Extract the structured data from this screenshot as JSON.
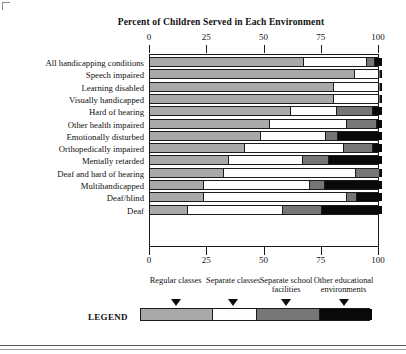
{
  "chart_data": {
    "type": "bar",
    "orientation": "horizontal",
    "stacked": true,
    "title": "Percent of Children Served in Each Environment",
    "xlabel": "",
    "ylabel": "",
    "xlim": [
      0,
      100
    ],
    "xticks": [
      0,
      25,
      50,
      75,
      100
    ],
    "xticklabels": [
      "0",
      "25",
      "50",
      "75",
      "100"
    ],
    "grid": false,
    "legend_position": "bottom",
    "categories": [
      "All handicapping conditions",
      "Speech impaired",
      "Learning disabled",
      "Visually handicapped",
      "Hard of hearing",
      "Other health impaired",
      "Emotionally disturbed",
      "Orthopedically impaired",
      "Mentally retarded",
      "Deaf and hard of hearing",
      "Multihandicapped",
      "Deaf/blind",
      "Deaf"
    ],
    "series": [
      {
        "name": "Regular classes",
        "color": "#a9a9a9",
        "values": [
          67,
          89,
          80,
          80,
          61,
          52,
          48,
          41,
          34,
          32,
          23,
          23,
          16
        ]
      },
      {
        "name": "Separate classes",
        "color": "#fdfdfd",
        "values": [
          27,
          10,
          19,
          19,
          20,
          33,
          28,
          43,
          32,
          57,
          46,
          62,
          41
        ]
      },
      {
        "name": "Separate school facilities",
        "color": "#767676",
        "values": [
          3,
          0.5,
          0.5,
          0.5,
          15,
          13,
          5,
          12,
          11,
          10,
          6,
          4,
          17
        ]
      },
      {
        "name": "Other educational environments",
        "color": "#090909",
        "values": [
          3,
          0.5,
          0.5,
          0.5,
          4,
          2,
          19,
          4,
          23,
          1,
          25,
          11,
          26
        ]
      }
    ]
  },
  "legend": {
    "word": "LEGEND",
    "keys": [
      {
        "label": "Regular classes",
        "color": "#a9a9a9"
      },
      {
        "label": "Separate classes",
        "color": "#fdfdfd"
      },
      {
        "label": "Separate school facilities",
        "color": "#767676"
      },
      {
        "label": "Other educational environments",
        "color": "#090909"
      }
    ]
  },
  "axis": {
    "top_ticks": [
      "0",
      "25",
      "50",
      "75",
      "100"
    ],
    "bottom_ticks": [
      "0",
      "25",
      "50",
      "75",
      "100"
    ]
  }
}
